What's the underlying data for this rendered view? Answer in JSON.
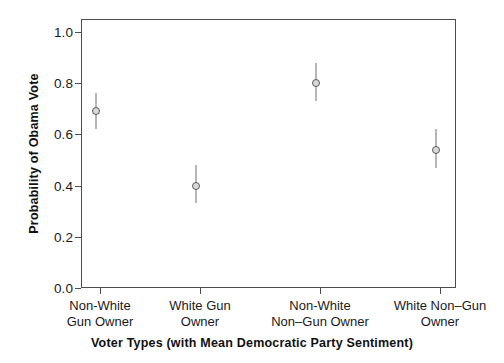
{
  "chart_data": {
    "type": "scatter",
    "title": "",
    "xlabel": "Voter Types (with Mean Democratic Party Sentiment)",
    "ylabel": "Probability of Obama Vote",
    "categories": [
      "Non-White Gun Owner",
      "White Gun Owner",
      "Non-White Non–Gun Owner",
      "White Non–Gun Owner"
    ],
    "category_lines": [
      [
        "Non-White",
        "Gun Owner"
      ],
      [
        "White Gun",
        "Owner"
      ],
      [
        "Non-White",
        "Non–Gun Owner"
      ],
      [
        "White Non–Gun",
        "Owner"
      ]
    ],
    "values": [
      0.69,
      0.4,
      0.8,
      0.54
    ],
    "ci_low": [
      0.62,
      0.33,
      0.73,
      0.47
    ],
    "ci_high": [
      0.76,
      0.48,
      0.88,
      0.62
    ],
    "ylim": [
      0.0,
      1.05
    ],
    "yticks": [
      0.0,
      0.2,
      0.4,
      0.6,
      0.8,
      1.0
    ],
    "ytick_labels": [
      "0.0",
      "0.2",
      "0.4",
      "0.6",
      "0.8",
      "1.0"
    ],
    "grid": false,
    "legend": "none",
    "marker": "open-circle",
    "errorbar_style": "vertical-line",
    "colors": {
      "axis": "#4d4d4d",
      "marker_fill": "#d9d9d9",
      "marker_edge": "#5a5a5a",
      "errorbar": "#6e6e6e",
      "text": "#1a1a1a",
      "background": "#ffffff"
    }
  }
}
